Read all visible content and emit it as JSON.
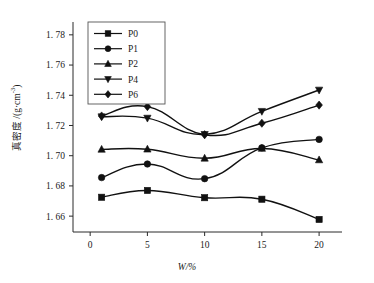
{
  "chart_data": {
    "type": "line",
    "title": "",
    "xlabel": "W/%",
    "ylabel": "真密度 /(g·cm-3)",
    "ylabel_main": "真密度 /(g·cm",
    "ylabel_sup": "-3",
    "ylabel_tail": ")",
    "x": [
      1,
      5,
      10,
      15,
      20
    ],
    "xlim": [
      -1.5,
      22
    ],
    "ylim": [
      1.6495,
      1.7885
    ],
    "xticks": [
      0,
      5,
      10,
      15,
      20
    ],
    "xtick_labels": [
      "0",
      "5",
      "10",
      "15",
      "20"
    ],
    "yticks": [
      1.66,
      1.68,
      1.7,
      1.72,
      1.74,
      1.76,
      1.78
    ],
    "ytick_labels": [
      "1. 66",
      "1. 68",
      "1. 70",
      "1. 72",
      "1. 74",
      "1. 76",
      "1. 78"
    ],
    "grid": false,
    "legend_position": "upper-left",
    "series": [
      {
        "name": "P0",
        "marker": "square",
        "values": [
          1.6725,
          1.677,
          1.6722,
          1.6712,
          1.6578
        ]
      },
      {
        "name": "P1",
        "marker": "circle",
        "values": [
          1.6855,
          1.6945,
          1.6848,
          1.7052,
          1.7108
        ]
      },
      {
        "name": "P2",
        "marker": "triangle-up",
        "values": [
          1.7042,
          1.7043,
          1.6983,
          1.7048,
          1.6972
        ]
      },
      {
        "name": "P4",
        "marker": "triangle-down",
        "values": [
          1.7258,
          1.7249,
          1.7141,
          1.7294,
          1.7435
        ]
      },
      {
        "name": "P6",
        "marker": "diamond",
        "values": [
          1.7263,
          1.7325,
          1.7139,
          1.7215,
          1.7335
        ]
      }
    ]
  },
  "legend": {
    "entries": [
      {
        "label": "P0"
      },
      {
        "label": "P1"
      },
      {
        "label": "P2"
      },
      {
        "label": "P4"
      },
      {
        "label": "P6"
      }
    ]
  },
  "colors": {
    "ink": "#111111",
    "axis": "#2a2a2a",
    "background": "#ffffff"
  }
}
